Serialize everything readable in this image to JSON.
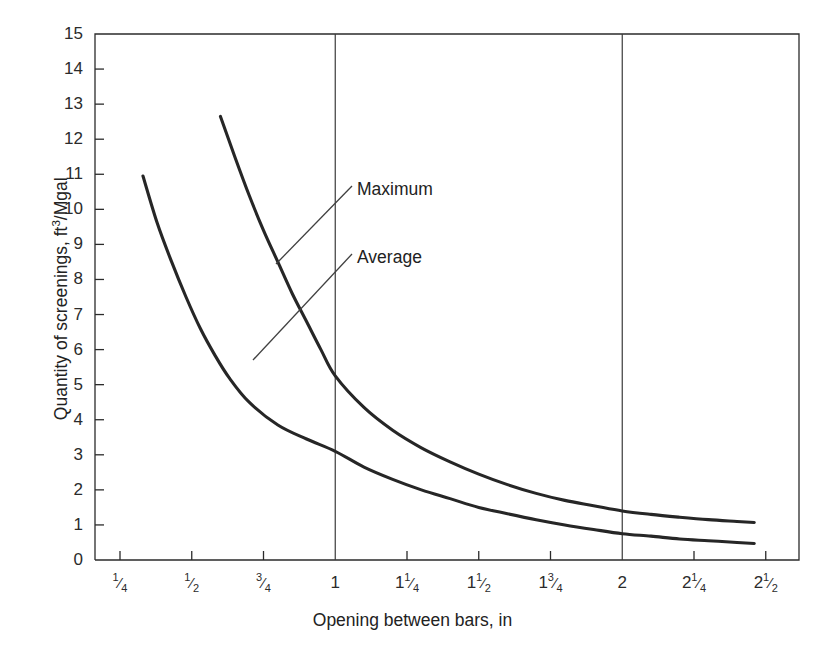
{
  "chart_data": {
    "type": "line",
    "title": "",
    "xlabel": "Opening between bars, in",
    "ylabel": "Quantity of screenings, ft3/Mgal",
    "ylabel_parts": {
      "prefix": "Quantity of screenings, ft",
      "sup": "3",
      "suffix": "/Mgal"
    },
    "xlim": [
      0.17,
      2.56
    ],
    "ylim": [
      0,
      15
    ],
    "grid": false,
    "gridlines_vertical": [
      1,
      2
    ],
    "legend_position": "inline-annotations",
    "x_ticks": [
      {
        "value": 0.25,
        "label": "1/4",
        "whole": "",
        "num": "1",
        "den": "4"
      },
      {
        "value": 0.5,
        "label": "1/2",
        "whole": "",
        "num": "1",
        "den": "2"
      },
      {
        "value": 0.75,
        "label": "3/4",
        "whole": "",
        "num": "3",
        "den": "4"
      },
      {
        "value": 1.0,
        "label": "1",
        "whole": "1",
        "num": "",
        "den": ""
      },
      {
        "value": 1.25,
        "label": "1 1/4",
        "whole": "1",
        "num": "1",
        "den": "4"
      },
      {
        "value": 1.5,
        "label": "1 1/2",
        "whole": "1",
        "num": "1",
        "den": "2"
      },
      {
        "value": 1.75,
        "label": "1 3/4",
        "whole": "1",
        "num": "3",
        "den": "4"
      },
      {
        "value": 2.0,
        "label": "2",
        "whole": "2",
        "num": "",
        "den": ""
      },
      {
        "value": 2.25,
        "label": "2 1/4",
        "whole": "2",
        "num": "1",
        "den": "4"
      },
      {
        "value": 2.5,
        "label": "2 1/2",
        "whole": "2",
        "num": "1",
        "den": "2"
      }
    ],
    "y_ticks": [
      {
        "value": 0,
        "label": "0"
      },
      {
        "value": 1,
        "label": "1"
      },
      {
        "value": 2,
        "label": "2"
      },
      {
        "value": 3,
        "label": "3"
      },
      {
        "value": 4,
        "label": "4"
      },
      {
        "value": 5,
        "label": "5"
      },
      {
        "value": 6,
        "label": "6"
      },
      {
        "value": 7,
        "label": "7"
      },
      {
        "value": 8,
        "label": "8"
      },
      {
        "value": 9,
        "label": "9"
      },
      {
        "value": 10,
        "label": "10"
      },
      {
        "value": 11,
        "label": "11"
      },
      {
        "value": 12,
        "label": "12"
      },
      {
        "value": 13,
        "label": "13"
      },
      {
        "value": 14,
        "label": "14"
      },
      {
        "value": 15,
        "label": "15"
      }
    ],
    "series": [
      {
        "name": "Maximum",
        "color": "#262626",
        "points": [
          [
            0.6,
            12.65
          ],
          [
            0.65,
            11.5
          ],
          [
            0.7,
            10.4
          ],
          [
            0.75,
            9.4
          ],
          [
            0.8,
            8.5
          ],
          [
            0.85,
            7.6
          ],
          [
            0.9,
            6.8
          ],
          [
            0.95,
            6.0
          ],
          [
            1.0,
            5.25
          ],
          [
            1.1,
            4.35
          ],
          [
            1.2,
            3.7
          ],
          [
            1.3,
            3.2
          ],
          [
            1.4,
            2.8
          ],
          [
            1.5,
            2.45
          ],
          [
            1.6,
            2.15
          ],
          [
            1.7,
            1.9
          ],
          [
            1.8,
            1.7
          ],
          [
            1.9,
            1.55
          ],
          [
            2.0,
            1.4
          ],
          [
            2.1,
            1.3
          ],
          [
            2.2,
            1.22
          ],
          [
            2.3,
            1.15
          ],
          [
            2.4,
            1.1
          ],
          [
            2.46,
            1.07
          ]
        ]
      },
      {
        "name": "Average",
        "color": "#262626",
        "points": [
          [
            0.33,
            10.95
          ],
          [
            0.38,
            9.6
          ],
          [
            0.43,
            8.5
          ],
          [
            0.48,
            7.5
          ],
          [
            0.53,
            6.6
          ],
          [
            0.58,
            5.85
          ],
          [
            0.63,
            5.2
          ],
          [
            0.7,
            4.5
          ],
          [
            0.8,
            3.85
          ],
          [
            0.9,
            3.45
          ],
          [
            1.0,
            3.1
          ],
          [
            1.1,
            2.65
          ],
          [
            1.2,
            2.3
          ],
          [
            1.3,
            2.0
          ],
          [
            1.4,
            1.75
          ],
          [
            1.5,
            1.5
          ],
          [
            1.6,
            1.32
          ],
          [
            1.7,
            1.15
          ],
          [
            1.8,
            1.0
          ],
          [
            1.9,
            0.87
          ],
          [
            2.0,
            0.75
          ],
          [
            2.1,
            0.68
          ],
          [
            2.2,
            0.6
          ],
          [
            2.3,
            0.55
          ],
          [
            2.4,
            0.5
          ],
          [
            2.46,
            0.47
          ]
        ]
      }
    ],
    "annotations": [
      {
        "name": "Maximum",
        "text": "Maximum",
        "text_x": 357,
        "text_y": 181,
        "leader": [
          [
            352,
            186
          ],
          [
            276,
            264
          ]
        ]
      },
      {
        "name": "Average",
        "text": "Average",
        "text_x": 357,
        "text_y": 249,
        "leader": [
          [
            352,
            254
          ],
          [
            253,
            360
          ]
        ]
      }
    ]
  },
  "axes": {
    "stroke_color": "#2b2b2b",
    "grid_color": "#3a3a3a"
  }
}
